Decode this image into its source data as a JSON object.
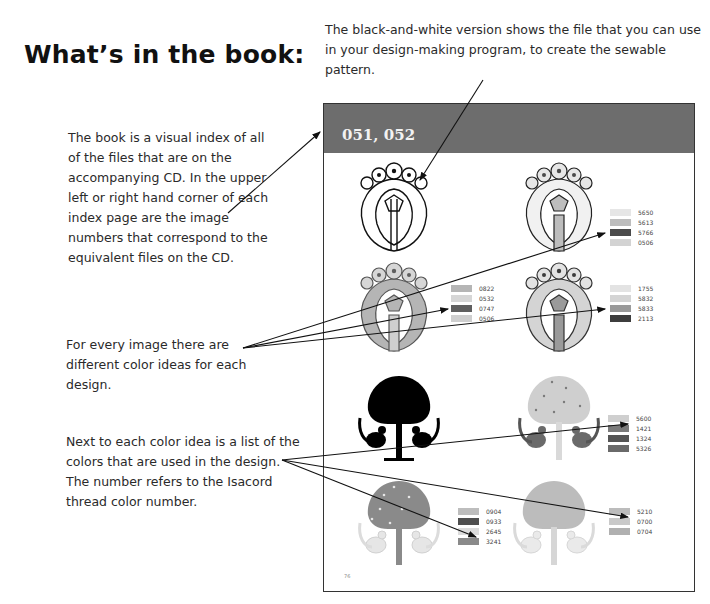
{
  "heading": "What’s in the book:",
  "callouts": {
    "bw_version": "The black-and-white version shows the file that you can use in your design-making program, to create the sewable pattern.",
    "visual_index": "The book is a visual index of all of the files that are on the accompanying CD. In the upper left or right hand corner of each index page are the image numbers that correspond to the equivalent files on the CD.",
    "color_ideas": "For every image there are different color ideas for each design.",
    "color_list": "Next to each color idea is a list of the colors that are used in the design. The number refers to the Isacord thread color number."
  },
  "page": {
    "image_numbers": "051, 052",
    "folio": "76",
    "band_color": "#6d6d6d",
    "designs": [
      {
        "name": "crest-bw",
        "legend": []
      },
      {
        "name": "crest-color-1",
        "legend": [
          {
            "code": "5650",
            "color": "#e6e6e6"
          },
          {
            "code": "5613",
            "color": "#bdbdbd"
          },
          {
            "code": "5766",
            "color": "#4a4a4a"
          },
          {
            "code": "0506",
            "color": "#d3d3d3"
          }
        ]
      },
      {
        "name": "crest-color-2",
        "legend": [
          {
            "code": "0822",
            "color": "#b5b5b5"
          },
          {
            "code": "0532",
            "color": "#d6d6d6"
          },
          {
            "code": "0747",
            "color": "#5f5f5f"
          },
          {
            "code": "0506",
            "color": "#cfcfcf"
          }
        ]
      },
      {
        "name": "crest-color-3",
        "legend": [
          {
            "code": "1755",
            "color": "#e3e3e3"
          },
          {
            "code": "5832",
            "color": "#d4d4d4"
          },
          {
            "code": "5833",
            "color": "#9a9a9a"
          },
          {
            "code": "2113",
            "color": "#3d3d3d"
          }
        ]
      },
      {
        "name": "tree-bw",
        "legend": []
      },
      {
        "name": "tree-color-1",
        "legend": [
          {
            "code": "5600",
            "color": "#cfcfcf"
          },
          {
            "code": "1421",
            "color": "#7a7a7a"
          },
          {
            "code": "1324",
            "color": "#555555"
          },
          {
            "code": "5326",
            "color": "#6a6a6a"
          }
        ]
      },
      {
        "name": "tree-color-2",
        "legend": [
          {
            "code": "0904",
            "color": "#bdbdbd"
          },
          {
            "code": "0933",
            "color": "#4f4f4f"
          },
          {
            "code": "2645",
            "color": "#dcdcdc"
          },
          {
            "code": "3241",
            "color": "#8a8a8a"
          }
        ]
      },
      {
        "name": "tree-color-3",
        "legend": [
          {
            "code": "5210",
            "color": "#bcbcbc"
          },
          {
            "code": "0700",
            "color": "#c9c9c9"
          },
          {
            "code": "0704",
            "color": "#b0b0b0"
          }
        ]
      }
    ]
  }
}
